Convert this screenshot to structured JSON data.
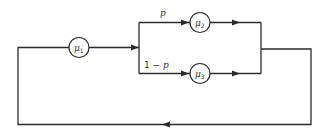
{
  "diagram": {
    "type": "queueing-network",
    "colors": {
      "line": "#2b2b2b",
      "background": "#ffffff",
      "text": "#333333"
    },
    "nodes": [
      {
        "id": "mu1",
        "symbol": "μ",
        "subscript": "1"
      },
      {
        "id": "mu2",
        "symbol": "μ",
        "subscript": "2"
      },
      {
        "id": "mu3",
        "symbol": "μ",
        "subscript": "3"
      }
    ],
    "branches": {
      "upper": {
        "label": "p"
      },
      "lower": {
        "prefix": "1 − ",
        "var": "p"
      }
    },
    "edges": [
      {
        "from": "mu1",
        "to": "split"
      },
      {
        "from": "split",
        "to": "mu2",
        "label": "p"
      },
      {
        "from": "split",
        "to": "mu3",
        "label": "1 − p"
      },
      {
        "from": "mu2",
        "to": "merge"
      },
      {
        "from": "mu3",
        "to": "merge"
      },
      {
        "from": "merge",
        "to": "mu1",
        "type": "feedback"
      }
    ]
  }
}
